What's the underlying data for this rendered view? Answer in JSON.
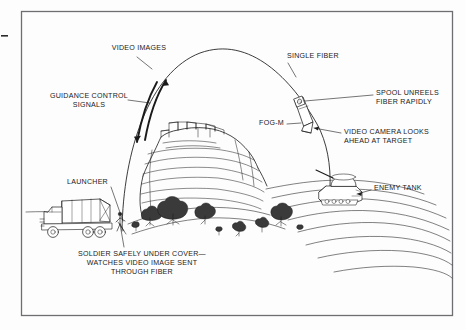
{
  "figure": {
    "title_semantic": "fog-m-fiber-optic-guided-missile-diagram",
    "border_color": "#6d6d72",
    "ink_color": "#1a1a1a",
    "background_color": "#fdfdfd"
  },
  "labels": {
    "video_images": "VIDEO IMAGES",
    "guidance_control_line1": "GUIDANCE CONTROL",
    "guidance_control_line2": "SIGNALS",
    "single_fiber": "SINGLE FIBER",
    "spool_line1": "SPOOL UNREELS",
    "spool_line2": "FIBER RAPIDLY",
    "fog_m": "FOG-M",
    "video_camera_line1": "VIDEO CAMERA LOOKS",
    "video_camera_line2": "AHEAD AT TARGET",
    "launcher": "LAUNCHER",
    "enemy_tank": "ENEMY TANK",
    "soldier_line1": "SOLDIER SAFELY UNDER COVER—",
    "soldier_line2": "WATCHES VIDEO IMAGE SENT",
    "soldier_line3": "THROUGH FIBER"
  },
  "scene": {
    "missile_label": "FOG-M",
    "trajectory_apex_x": 215,
    "trajectory_apex_y": 50,
    "launch_point_x": 122,
    "launch_point_y": 231,
    "impact_point_x": 330,
    "impact_point_y": 190
  }
}
